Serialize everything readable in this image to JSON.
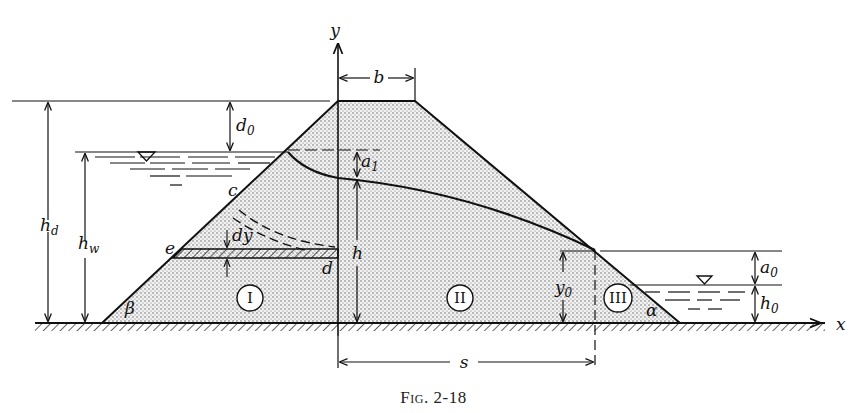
{
  "figure": {
    "caption": "Fig. 2-18",
    "axes": {
      "x_label": "x",
      "y_label": "y"
    },
    "dimensions": {
      "crest_width": "b",
      "freeboard": "d",
      "freeboard_sub": "0",
      "dam_height": "h",
      "dam_height_sub": "d",
      "water_depth": "h",
      "water_depth_sub": "w",
      "seepage_drop": "a",
      "seepage_drop_sub": "1",
      "head_at_axis": "h",
      "exit_height": "y",
      "exit_height_sub": "0",
      "seepage_face": "a",
      "seepage_face_sub": "0",
      "tailwater": "h",
      "tailwater_sub": "0",
      "base_length": "s",
      "strip_thickness": "dy"
    },
    "points": {
      "c": "c",
      "d": "d",
      "e": "e"
    },
    "angles": {
      "upstream": "β",
      "downstream": "α"
    },
    "zones": [
      "I",
      "II",
      "III"
    ],
    "water_symbol": "▽",
    "colors": {
      "ink": "#111111",
      "fill": "#e9e9e9",
      "background": "#ffffff"
    }
  }
}
